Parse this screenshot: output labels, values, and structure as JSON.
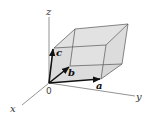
{
  "diagram": {
    "axes": {
      "x": {
        "label": "x"
      },
      "y": {
        "label": "y"
      },
      "z": {
        "label": "z"
      }
    },
    "origin_label": "0",
    "vectors": [
      {
        "name": "a",
        "label": "a"
      },
      {
        "name": "b",
        "label": "b"
      },
      {
        "name": "c",
        "label": "c"
      }
    ],
    "colors": {
      "face_fill": "#d9d9d9",
      "edge": "#555555",
      "axis": "#666666",
      "vector": "#111111"
    }
  }
}
